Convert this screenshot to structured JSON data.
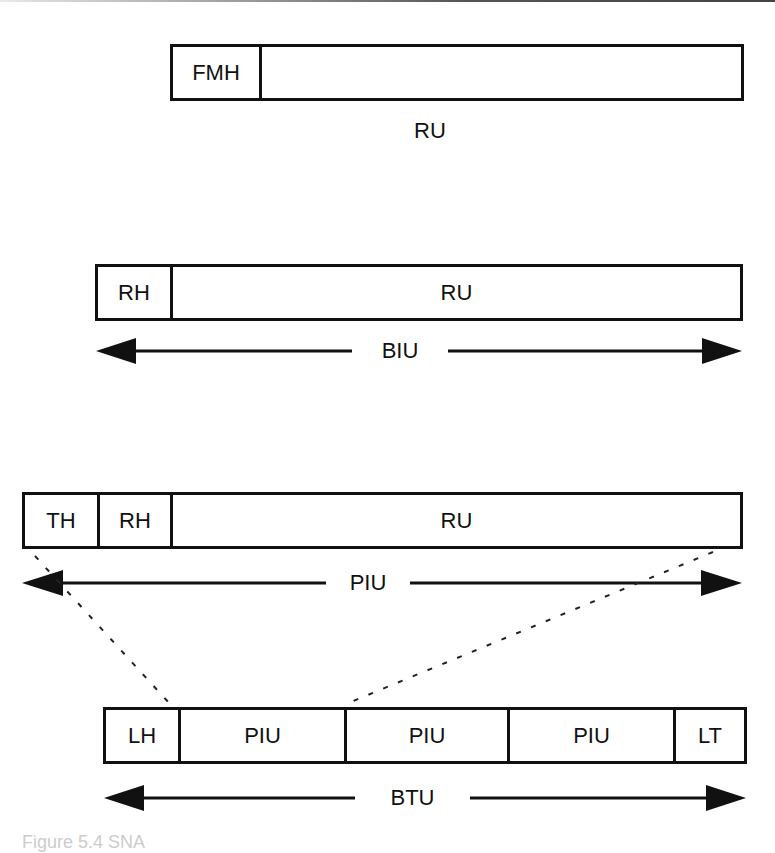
{
  "diagram": {
    "row1": {
      "cells": [
        {
          "label": "FMH",
          "width": 89
        },
        {
          "label": "",
          "width": 484
        }
      ],
      "caption": "RU"
    },
    "row2": {
      "cells": [
        {
          "label": "RH",
          "width": 75
        },
        {
          "label": "RU",
          "width": 572
        }
      ],
      "span_label": "BIU"
    },
    "row3": {
      "cells": [
        {
          "label": "TH",
          "width": 75
        },
        {
          "label": "RH",
          "width": 73
        },
        {
          "label": "RU",
          "width": 572
        }
      ],
      "span_label": "PIU"
    },
    "row4": {
      "cells": [
        {
          "label": "LH",
          "width": 75
        },
        {
          "label": "PIU",
          "width": 166
        },
        {
          "label": "PIU",
          "width": 163
        },
        {
          "label": "PIU",
          "width": 166
        },
        {
          "label": "LT",
          "width": 73
        }
      ],
      "span_label": "BTU"
    },
    "figure_caption": "Figure 5.4  SNA"
  }
}
